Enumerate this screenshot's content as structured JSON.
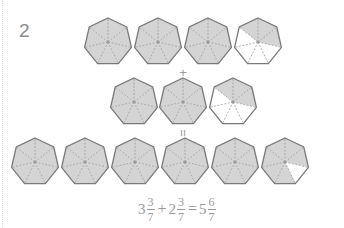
{
  "problem": {
    "number": "2"
  },
  "colors": {
    "fill": "#d4d4d4",
    "stroke": "#7a7a7a",
    "dash": "#9a9a9a",
    "empty": "#ffffff",
    "text": "#999999"
  },
  "operators": {
    "plus": "+",
    "equals": "="
  },
  "rows": [
    {
      "label": "addend-1",
      "cy": 42,
      "shapes": [
        {
          "cx": 108,
          "shaded": 7
        },
        {
          "cx": 158,
          "shaded": 7
        },
        {
          "cx": 208,
          "shaded": 7
        },
        {
          "cx": 258,
          "shaded": [
            6,
            0,
            1
          ]
        }
      ]
    },
    {
      "label": "addend-2",
      "cy": 102,
      "shapes": [
        {
          "cx": 134,
          "shaded": 7
        },
        {
          "cx": 183,
          "shaded": 7
        },
        {
          "cx": 233,
          "shaded": [
            6,
            0,
            1
          ]
        }
      ]
    },
    {
      "label": "sum",
      "cy": 162,
      "shapes": [
        {
          "cx": 35,
          "shaded": 7
        },
        {
          "cx": 85,
          "shaded": 7
        },
        {
          "cx": 135,
          "shaded": 7
        },
        {
          "cx": 185,
          "shaded": 7
        },
        {
          "cx": 235,
          "shaded": 7
        },
        {
          "cx": 285,
          "shaded": [
            6,
            0,
            1,
            3,
            4,
            5
          ]
        }
      ]
    }
  ],
  "formula": {
    "a_whole": "3",
    "a_num": "3",
    "a_den": "7",
    "plus": "+",
    "b_whole": "2",
    "b_num": "3",
    "b_den": "7",
    "equals": "=",
    "c_whole": "5",
    "c_num": "6",
    "c_den": "7"
  }
}
